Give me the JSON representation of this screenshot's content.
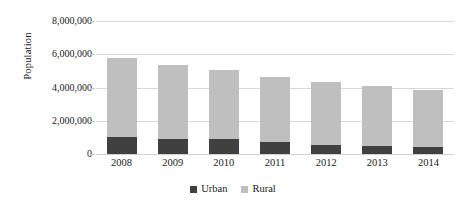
{
  "chart_data": {
    "type": "bar",
    "subtype": "stacked-bar",
    "title": "",
    "xlabel": "",
    "ylabel": "Population",
    "categories": [
      "2008",
      "2009",
      "2010",
      "2011",
      "2012",
      "2013",
      "2014"
    ],
    "series": [
      {
        "name": "Urban",
        "color": "#404040",
        "values": [
          1050000,
          930000,
          900000,
          730000,
          560000,
          490000,
          420000
        ]
      },
      {
        "name": "Rural",
        "color": "#bfbfbf",
        "values": [
          4700000,
          4420000,
          4150000,
          3920000,
          3770000,
          3580000,
          3450000
        ]
      }
    ],
    "totals": [
      5750000,
      5350000,
      5050000,
      4650000,
      4330000,
      4070000,
      3870000
    ],
    "ylim": [
      0,
      8000000
    ],
    "ytick_values": [
      0,
      2000000,
      4000000,
      6000000,
      8000000
    ],
    "ytick_labels": [
      "0",
      "2,000,000",
      "4,000,000",
      "6,000,000",
      "8,000,000"
    ],
    "grid": true,
    "legend_position": "bottom",
    "legend_entries": [
      "Urban",
      "Rural"
    ],
    "background_color": "#ffffff",
    "gridline_color": "#d9d9d9"
  }
}
